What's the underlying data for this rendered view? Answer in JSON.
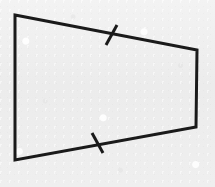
{
  "figure": {
    "kind": "geometry-diagram",
    "shape_name": "quadrilateral",
    "canvas": {
      "width": 215,
      "height": 187
    },
    "colors": {
      "background": "#eeeeee",
      "stroke": "#1a1a1a",
      "interior": "transparent"
    },
    "stroke_width": 3,
    "tick_stroke_width": 3,
    "vertices": [
      {
        "label": "top-left",
        "x": 15,
        "y": 15
      },
      {
        "label": "top-right",
        "x": 197,
        "y": 50
      },
      {
        "label": "bottom-right",
        "x": 196,
        "y": 127
      },
      {
        "label": "bottom-left",
        "x": 15,
        "y": 160
      }
    ],
    "edges": [
      {
        "name": "top-edge",
        "from": "top-left",
        "to": "top-right",
        "ticks": 1
      },
      {
        "name": "right-edge",
        "from": "top-right",
        "to": "bottom-right",
        "ticks": 0
      },
      {
        "name": "bottom-edge",
        "from": "bottom-right",
        "to": "bottom-left",
        "ticks": 1
      },
      {
        "name": "left-edge",
        "from": "bottom-left",
        "to": "top-left",
        "ticks": 0
      }
    ],
    "polygon_points": "15,15 197,50 196,127 15,160",
    "tick_marks": [
      {
        "name": "top-edge-tick",
        "on_edge": "top-edge",
        "center_x": 112,
        "center_y": 35,
        "x1": 117,
        "y1": 25,
        "x2": 106,
        "y2": 45
      },
      {
        "name": "bottom-edge-tick",
        "on_edge": "bottom-edge",
        "center_x": 97,
        "center_y": 143,
        "x1": 92,
        "y1": 133,
        "x2": 103,
        "y2": 153
      }
    ]
  }
}
